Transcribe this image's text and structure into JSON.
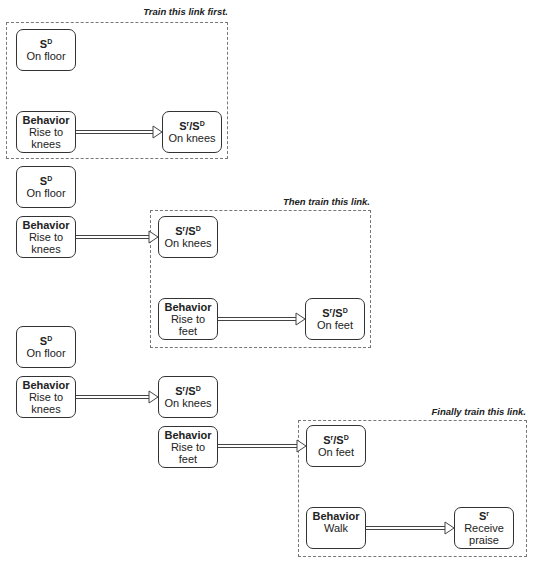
{
  "stages": [
    {
      "caption": "Train this link first.",
      "boxes": {
        "sd": {
          "title_base": "S",
          "title_sup": "D",
          "line1": "On floor"
        },
        "behavior": {
          "title": "Behavior",
          "line1": "Rise to",
          "line2": "knees"
        },
        "result": {
          "t1": "S",
          "s1": "r",
          "t2": "/S",
          "s2": "D",
          "line1": "On knees"
        }
      }
    },
    {
      "caption": "Then train this link.",
      "boxes": {
        "sd": {
          "title_base": "S",
          "title_sup": "D",
          "line1": "On floor"
        },
        "behavior1": {
          "title": "Behavior",
          "line1": "Rise to",
          "line2": "knees"
        },
        "result1": {
          "t1": "S",
          "s1": "r",
          "t2": "/S",
          "s2": "D",
          "line1": "On knees"
        },
        "behavior2": {
          "title": "Behavior",
          "line1": "Rise to",
          "line2": "feet"
        },
        "result2": {
          "t1": "S",
          "s1": "r",
          "t2": "/S",
          "s2": "D",
          "line1": "On feet"
        }
      }
    },
    {
      "caption": "Finally train this link.",
      "boxes": {
        "sd": {
          "title_base": "S",
          "title_sup": "D",
          "line1": "On floor"
        },
        "behavior1": {
          "title": "Behavior",
          "line1": "Rise to",
          "line2": "knees"
        },
        "result1": {
          "t1": "S",
          "s1": "r",
          "t2": "/S",
          "s2": "D",
          "line1": "On knees"
        },
        "behavior2": {
          "title": "Behavior",
          "line1": "Rise to",
          "line2": "feet"
        },
        "result2": {
          "t1": "S",
          "s1": "r",
          "t2": "/S",
          "s2": "D",
          "line1": "On feet"
        },
        "behavior3": {
          "title": "Behavior",
          "line1": "Walk"
        },
        "result3": {
          "title_base": "S",
          "title_sup": "r",
          "line1": "Receive",
          "line2": "praise"
        }
      }
    }
  ]
}
